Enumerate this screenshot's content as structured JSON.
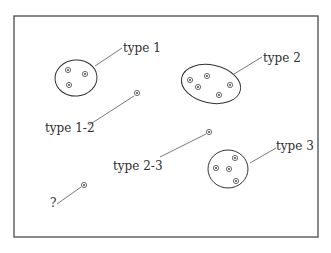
{
  "diagram": {
    "frame": {
      "x": 14,
      "y": 16,
      "width": 304,
      "height": 221
    },
    "colors": {
      "stroke": "#333333",
      "background": "#ffffff",
      "text": "#2e2e2e"
    },
    "groups": [
      {
        "id": "type-1",
        "label": "type 1",
        "kind": "cluster",
        "shape": {
          "cx": 76,
          "cy": 78,
          "rx": 21,
          "ry": 18,
          "rotate": -5
        },
        "points": [
          [
            68,
            70
          ],
          [
            85,
            74
          ],
          [
            69,
            85
          ]
        ],
        "label_pos": [
          123,
          52
        ],
        "leader": [
          [
            95,
            66
          ],
          [
            122,
            48
          ]
        ]
      },
      {
        "id": "type-2",
        "label": "type 2",
        "kind": "cluster",
        "shape": {
          "cx": 211,
          "cy": 84,
          "rx": 30,
          "ry": 19,
          "rotate": 12
        },
        "points": [
          [
            190,
            80
          ],
          [
            207,
            76
          ],
          [
            198,
            87
          ],
          [
            230,
            85
          ],
          [
            219,
            95
          ]
        ],
        "label_pos": [
          263,
          62
        ],
        "leader": [
          [
            234,
            74
          ],
          [
            262,
            57
          ]
        ]
      },
      {
        "id": "type-1-2",
        "label": "type 1-2",
        "kind": "single",
        "points": [
          [
            137,
            93
          ]
        ],
        "label_pos": [
          45,
          132
        ],
        "leader": [
          [
            89,
            125
          ],
          [
            134,
            96
          ]
        ]
      },
      {
        "id": "type-2-3",
        "label": "type 2-3",
        "kind": "single",
        "points": [
          [
            209,
            132
          ]
        ],
        "label_pos": [
          113,
          170
        ],
        "leader": [
          [
            160,
            157
          ],
          [
            206,
            134
          ]
        ]
      },
      {
        "id": "type-3",
        "label": "type 3",
        "kind": "cluster",
        "shape": {
          "cx": 228,
          "cy": 169,
          "rx": 20,
          "ry": 19,
          "rotate": 0
        },
        "points": [
          [
            235,
            158
          ],
          [
            216,
            168
          ],
          [
            229,
            169
          ],
          [
            236,
            181
          ]
        ],
        "label_pos": [
          276,
          150
        ],
        "leader": [
          [
            250,
            163
          ],
          [
            276,
            148
          ]
        ]
      },
      {
        "id": "unknown",
        "label": "?",
        "kind": "single",
        "points": [
          [
            84,
            185
          ]
        ],
        "label_pos": [
          50,
          207
        ],
        "leader": [
          [
            57,
            204
          ],
          [
            81,
            187
          ]
        ]
      }
    ]
  }
}
